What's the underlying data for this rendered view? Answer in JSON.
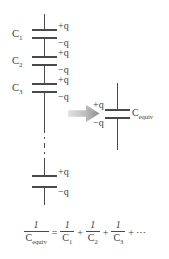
{
  "figure": {
    "ink_color": "#4a4a4a",
    "text_color": "#3d3d3d",
    "background": "#ffffff",
    "arrow": {
      "name": "transformation-arrow",
      "direction": "right",
      "color_start": "#d8d8d8",
      "color_end": "#9a9a9a"
    }
  },
  "series_circuit": {
    "capacitors": [
      {
        "label": "C",
        "subscript": "1",
        "top_charge": "+q",
        "bottom_charge": "−q"
      },
      {
        "label": "C",
        "subscript": "2",
        "top_charge": "+q",
        "bottom_charge": "−q"
      },
      {
        "label": "C",
        "subscript": "3",
        "top_charge": "+q",
        "bottom_charge": "−q"
      }
    ],
    "continuation": {
      "name": "series-continuation-dashes",
      "style": "dash-dot"
    },
    "last_capacitor": {
      "label": "",
      "top_charge": "+q",
      "bottom_charge": "−q"
    }
  },
  "equivalent_circuit": {
    "label": "C",
    "subscript": "equiv",
    "top_charge": "+q",
    "bottom_charge": "−q"
  },
  "equation": {
    "lhs": {
      "numerator": "1",
      "denominator": "C",
      "denominator_sub": "equiv"
    },
    "equals": "=",
    "terms": [
      {
        "numerator": "1",
        "denominator": "C",
        "denominator_sub": "1"
      },
      {
        "numerator": "1",
        "denominator": "C",
        "denominator_sub": "2"
      },
      {
        "numerator": "1",
        "denominator": "C",
        "denominator_sub": "3"
      }
    ],
    "plus": "+",
    "ellipsis": "⋯"
  }
}
